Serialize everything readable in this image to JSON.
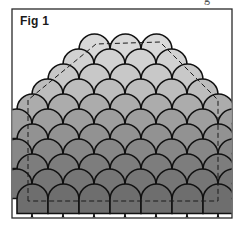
{
  "figure": {
    "label": "Fig 1",
    "cut_off_text_top_right": "g",
    "frame": {
      "x": 12,
      "y": 9,
      "width": 220,
      "height": 209,
      "stroke": "#2a2a2a"
    },
    "scale": {
      "width": 31,
      "row_step": 15,
      "stroke": "#111111"
    },
    "rows": [
      {
        "y": 34,
        "x_start": 79,
        "count": 3,
        "fill": "#d9d9d9"
      },
      {
        "y": 49,
        "x_start": 63,
        "count": 4,
        "fill": "#d2d2d2"
      },
      {
        "y": 64,
        "x_start": 48,
        "count": 5,
        "fill": "#c8c8c8"
      },
      {
        "y": 79,
        "x_start": 32,
        "count": 6,
        "fill": "#bdbdbd"
      },
      {
        "y": 94,
        "x_start": 17,
        "count": 7,
        "fill": "#acacac"
      },
      {
        "y": 109,
        "x_start": 1,
        "count": 8,
        "fill": "#9e9e9e"
      },
      {
        "y": 124,
        "x_start": 17,
        "count": 7,
        "fill": "#929292"
      },
      {
        "y": 139,
        "x_start": 1,
        "count": 8,
        "fill": "#878787"
      },
      {
        "y": 154,
        "x_start": 17,
        "count": 7,
        "fill": "#7d7d7d"
      },
      {
        "y": 169,
        "x_start": 1,
        "count": 8,
        "fill": "#767676"
      },
      {
        "y": 184,
        "x_start": 17,
        "count": 7,
        "fill": "#6e6e6e"
      }
    ],
    "dashed_outline": "M28,201 L28,100 L96,44 L160,42 L218,100 L218,201 Z",
    "colors": {
      "background": "#ffffff",
      "outline": "#111111",
      "light_scale": "#d9d9d9",
      "dark_scale": "#6e6e6e"
    }
  }
}
